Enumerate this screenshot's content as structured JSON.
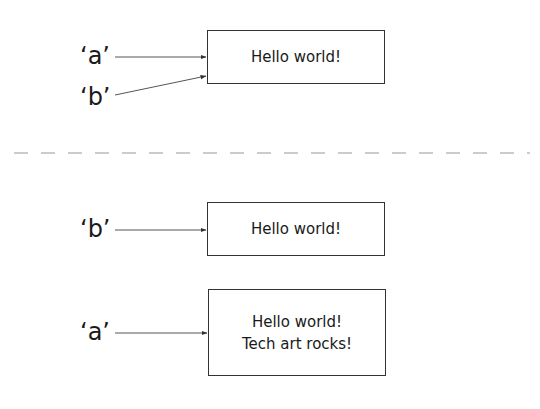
{
  "top_panel": {
    "labels": [
      "‘a’",
      "‘b’"
    ],
    "box": {
      "lines": [
        "Hello world!"
      ]
    }
  },
  "bottom_panel": {
    "items": [
      {
        "label": "‘b’",
        "box": {
          "lines": [
            "Hello world!"
          ]
        }
      },
      {
        "label": "‘a’",
        "box": {
          "lines": [
            "Hello world!",
            "Tech art rocks!"
          ]
        }
      }
    ]
  },
  "colors": {
    "stroke": "#333333",
    "divider": "#999999",
    "text": "#1a1a1a"
  }
}
